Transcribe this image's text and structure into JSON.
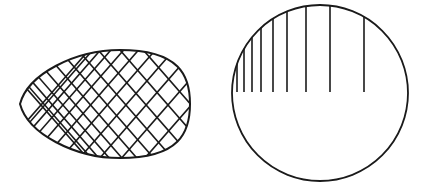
{
  "figures": [
    {
      "name": "egg-lattice",
      "description": "Egg-shaped outline filled with two families of crossing straight lines converging toward the left tip",
      "stroke": "#1a1a1a",
      "outline": {
        "left_tip": [
          20,
          101
        ],
        "right_x": 190,
        "top_y": 50,
        "bottom_y": 158
      },
      "line_families": 2,
      "lines_per_family": 12
    },
    {
      "name": "circle-verticals",
      "description": "Circle with vertical chords from the upper arc down to the horizontal diameter, spacing increasing to the right",
      "stroke": "#1a1a1a",
      "circle": {
        "cx": 320,
        "cy": 93,
        "r": 88
      },
      "vertical_lines_x": [
        237,
        244,
        252,
        261,
        273,
        287,
        306,
        330,
        364
      ],
      "vertical_lines_bottom_y": 92
    }
  ]
}
